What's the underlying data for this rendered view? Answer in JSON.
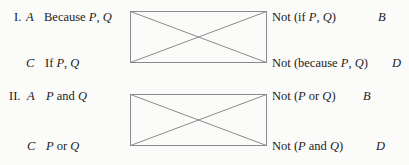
{
  "figure": {
    "type": "logical-square-of-opposition",
    "background": "#fbfbf9",
    "line_color": "#8a8a8a",
    "text_color": "#1c1c1c",
    "groups": [
      {
        "numeral": "I.",
        "corners": {
          "top_left_letter": "A",
          "top_right_letter": "B",
          "bottom_left_letter": "C",
          "bottom_right_letter": "D"
        },
        "top_left_text": "Because P, Q",
        "top_right_text": "Not (if P, Q)",
        "bottom_left_text": "If P, Q",
        "bottom_right_text": "Not (because P, Q)"
      },
      {
        "numeral": "II.",
        "corners": {
          "top_left_letter": "A",
          "top_right_letter": "B",
          "bottom_left_letter": "C",
          "bottom_right_letter": "D"
        },
        "top_left_text": "P and Q",
        "top_right_text": "Not (P or Q)",
        "bottom_left_text": "P or Q",
        "bottom_right_text": "Not (P and Q)"
      }
    ]
  }
}
